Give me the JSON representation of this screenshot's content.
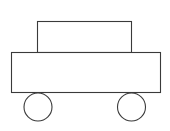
{
  "diagram": {
    "title": "",
    "stroke_color": "#3a3a3a",
    "fill_color": "#ffffff",
    "background_color": "#ffffff",
    "parts": [
      {
        "name": "car-roof",
        "shape": "rectangle"
      },
      {
        "name": "car-body",
        "shape": "rectangle"
      },
      {
        "name": "front-wheel",
        "shape": "circle"
      },
      {
        "name": "rear-wheel",
        "shape": "circle"
      }
    ]
  }
}
